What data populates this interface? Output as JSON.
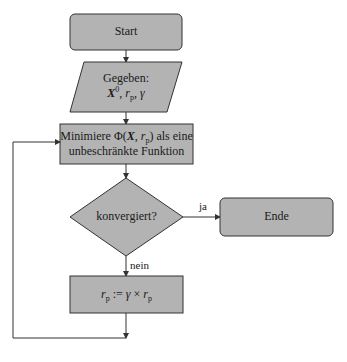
{
  "colors": {
    "box_fill": "#b3b3b3",
    "stroke": "#333333",
    "background": "#ffffff"
  },
  "nodes": {
    "start": {
      "label": "Start",
      "shape": "rounded-rectangle"
    },
    "input": {
      "shape": "parallelogram",
      "line1": "Gegeben:",
      "x_sym": "X",
      "x_sup": "0",
      "sep1": ", ",
      "r_sym": "r",
      "r_sub": "p",
      "sep2": ", ",
      "gamma": "γ"
    },
    "minimize": {
      "shape": "rectangle",
      "pre": "Minimiere Φ(",
      "x_sym": "X",
      "comma": ", ",
      "r_sym": "r",
      "r_sub": "p",
      "post": ") als eine",
      "line2": "unbeschränkte Funktion"
    },
    "decision": {
      "shape": "diamond",
      "label": "konvergiert?"
    },
    "end": {
      "label": "Ende",
      "shape": "rounded-rectangle"
    },
    "update": {
      "shape": "rectangle",
      "r_sym": "r",
      "r_sub": "p",
      "assign": " := ",
      "gamma": "γ",
      "times": " × ",
      "r_sym2": "r",
      "r_sub2": "p"
    }
  },
  "edges": {
    "yes_label": "ja",
    "no_label": "nein"
  }
}
